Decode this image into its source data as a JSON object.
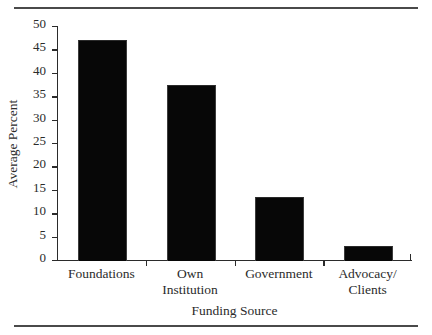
{
  "figure": {
    "rules": [
      "top-rule",
      "bottom-rule"
    ]
  },
  "chart_data": {
    "type": "bar",
    "title": "",
    "categories": [
      "Foundations",
      "Own\nInstitution",
      "Government",
      "Advocacy/\nClients"
    ],
    "values": [
      47,
      37.5,
      13.5,
      3
    ],
    "xlabel": "Funding Source",
    "ylabel": "Average Percent",
    "ylim": [
      0,
      50
    ],
    "yticks": [
      0,
      5,
      10,
      15,
      20,
      25,
      30,
      35,
      40,
      45,
      50
    ],
    "ytick_labels": [
      "0",
      "5",
      "10",
      "15",
      "20",
      "25",
      "30",
      "35",
      "40",
      "45",
      "50"
    ],
    "grid": false,
    "legend": null,
    "bar_color": "#070707",
    "axis_color": "#2b2b2b",
    "background": "#ffffff"
  }
}
